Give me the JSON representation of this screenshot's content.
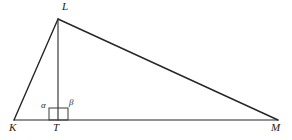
{
  "figure": {
    "kind": "geometry-diagram",
    "background_color": "#ffffff",
    "stroke_color": "#262626",
    "label_color": "#1b1b1b"
  },
  "points": {
    "K": {
      "label": "K",
      "x": 14,
      "y": 120,
      "label_x": 9,
      "label_y": 124
    },
    "L": {
      "label": "L",
      "x": 58,
      "y": 19,
      "label_x": 62,
      "label_y": 2
    },
    "M": {
      "label": "M",
      "x": 278,
      "y": 120,
      "label_x": 272,
      "label_y": 124
    },
    "T": {
      "label": "T",
      "x": 58,
      "y": 120,
      "label_x": 54,
      "label_y": 124
    }
  },
  "segments": [
    {
      "name": "side-KL",
      "from": "K",
      "to": "L",
      "x1": 14,
      "y1": 120,
      "x2": 58,
      "y2": 19,
      "width": 1.4
    },
    {
      "name": "side-LM",
      "from": "L",
      "to": "M",
      "x1": 58,
      "y1": 19,
      "x2": 278,
      "y2": 120,
      "width": 1.4
    },
    {
      "name": "base-KM",
      "from": "K",
      "to": "M",
      "x1": 14,
      "y1": 120,
      "x2": 278,
      "y2": 120,
      "width": 1.2
    },
    {
      "name": "altitude-LT",
      "from": "L",
      "to": "T",
      "x1": 58,
      "y1": 19,
      "x2": 58,
      "y2": 120,
      "width": 1.2
    }
  ],
  "angles": [
    {
      "name": "alpha",
      "symbol": "α",
      "at": "T",
      "side": "left",
      "label_x": 41,
      "label_y": 102
    },
    {
      "name": "beta",
      "symbol": "β",
      "at": "T",
      "side": "right",
      "label_x": 69,
      "label_y": 99
    }
  ],
  "right_angle_marker": {
    "name": "right-angle-square",
    "x": 49,
    "y": 108,
    "width": 19,
    "height": 12,
    "stroke_width": 1
  }
}
